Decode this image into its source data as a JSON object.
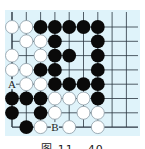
{
  "caption": "图 11 - 40",
  "colors": {
    "board": "#dff3fa",
    "line": "#2a3540",
    "black_stone": "#0a0a0a",
    "white_stone": "#ffffff",
    "white_stone_edge": "#8a9aa4"
  },
  "board": {
    "columns": 9,
    "rows": 8,
    "open_top": true,
    "open_right": true,
    "closed_left": true,
    "closed_bottom": true,
    "grid": [
      "WWBBBBB..",
      ".WWB..B..",
      "W.WBB.B..",
      "WWBB..B..",
      "AWWBBBB..",
      "BBBWWWB..",
      "B.BW.WW..",
      ".BW#W.W.."
    ],
    "labels": [
      {
        "text": "A",
        "col": 0,
        "row": 4
      },
      {
        "text": "B",
        "col": 3,
        "row": 7
      }
    ]
  }
}
